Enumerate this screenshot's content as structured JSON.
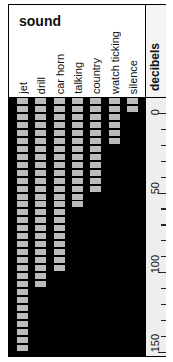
{
  "chart_data": {
    "type": "bar",
    "orientation": "vertical-downward",
    "title": "sound",
    "xlabel": "sound",
    "ylabel": "decibels",
    "categories": [
      "jet",
      "drill",
      "car horn",
      "talking",
      "country",
      "watch ticking",
      "silence"
    ],
    "values": [
      150,
      110,
      100,
      60,
      50,
      20,
      0
    ],
    "ylim": [
      -10,
      155
    ],
    "y_ticks": [
      0,
      50,
      100,
      150
    ],
    "minor_tick_step": 10,
    "block_step_db": 5,
    "grid": false,
    "legend": null
  },
  "header": {
    "title": "sound",
    "axis_title": "decibels"
  },
  "colors": {
    "background": "#000000",
    "block": "#bbbbbb",
    "axis_bg": "#eeeeee"
  }
}
